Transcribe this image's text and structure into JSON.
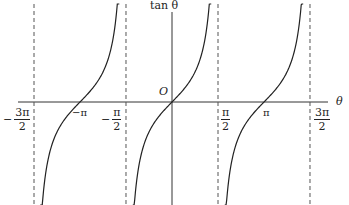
{
  "chart_data": {
    "type": "line",
    "title": "",
    "function": "tan θ",
    "xlabel": "θ",
    "ylabel": "tan θ",
    "origin_label": "O",
    "xlim": [
      -4.9,
      5.3
    ],
    "ylim": [
      -3.3,
      3.3
    ],
    "grid": false,
    "asymptotes": [
      -4.712,
      -1.571,
      1.571,
      4.712
    ],
    "asymptote_labels": [
      "-3π/2",
      "-π/2",
      "π/2",
      "3π/2"
    ],
    "zeros": [
      -3.1416,
      0,
      3.1416
    ],
    "zero_labels": [
      "-π",
      "O",
      "π"
    ],
    "branches": [
      {
        "from": -4.5,
        "to": -1.8,
        "center": -3.1416
      },
      {
        "from": -1.34,
        "to": 1.34,
        "center": 0
      },
      {
        "from": 1.8,
        "to": 4.48,
        "center": 3.1416
      }
    ],
    "series": [
      {
        "name": "tan θ",
        "color": "#222222"
      }
    ]
  },
  "labels": {
    "y_axis": "tan θ",
    "x_axis": "θ",
    "origin": "O",
    "neg_three_pi_half": {
      "sign": "−",
      "num": "3π",
      "den": "2"
    },
    "neg_pi": "−π",
    "neg_pi_half": {
      "sign": "−",
      "num": "π",
      "den": "2"
    },
    "pi_half": {
      "sign": "",
      "num": "π",
      "den": "2"
    },
    "pi": "π",
    "three_pi_half": {
      "sign": "",
      "num": "3π",
      "den": "2"
    }
  }
}
